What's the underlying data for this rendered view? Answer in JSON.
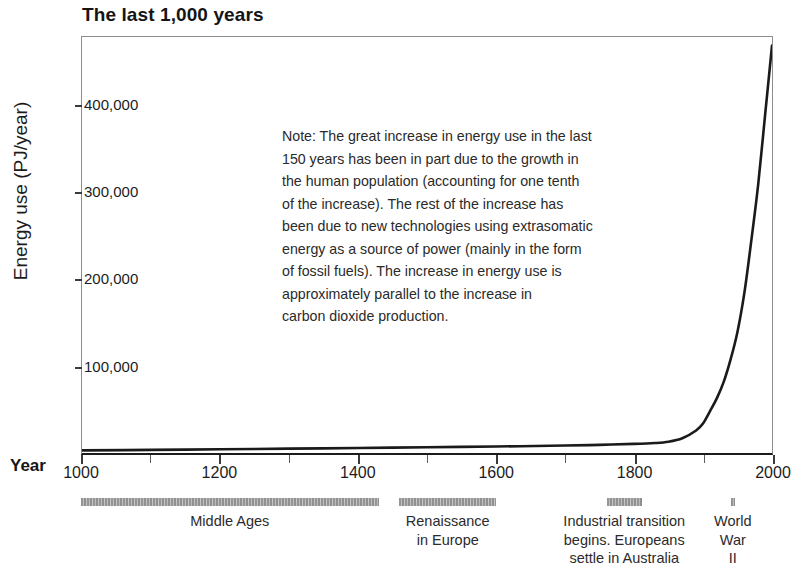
{
  "chart_data": {
    "type": "line",
    "title": "The last 1,000 years",
    "xlabel": "Year",
    "ylabel": "Energy use (PJ/year)",
    "xlim": [
      1000,
      2000
    ],
    "ylim": [
      0,
      480000
    ],
    "grid": false,
    "legend": "none",
    "x_ticks": [
      {
        "value": 1000,
        "label": "1000",
        "major": true
      },
      {
        "value": 1100,
        "label": "",
        "major": false
      },
      {
        "value": 1200,
        "label": "1200",
        "major": true
      },
      {
        "value": 1300,
        "label": "",
        "major": false
      },
      {
        "value": 1400,
        "label": "1400",
        "major": true
      },
      {
        "value": 1500,
        "label": "",
        "major": false
      },
      {
        "value": 1600,
        "label": "1600",
        "major": true
      },
      {
        "value": 1700,
        "label": "",
        "major": false
      },
      {
        "value": 1800,
        "label": "1800",
        "major": true
      },
      {
        "value": 1900,
        "label": "",
        "major": false
      },
      {
        "value": 2000,
        "label": "2000",
        "major": true
      }
    ],
    "y_ticks": [
      {
        "value": 100000,
        "label": "100,000"
      },
      {
        "value": 200000,
        "label": "200,000"
      },
      {
        "value": 300000,
        "label": "300,000"
      },
      {
        "value": 400000,
        "label": "400,000"
      }
    ],
    "series": [
      {
        "name": "World energy use",
        "color": "#1a1a1a",
        "x": [
          1000,
          1100,
          1200,
          1300,
          1400,
          1500,
          1600,
          1700,
          1750,
          1800,
          1830,
          1850,
          1870,
          1890,
          1900,
          1910,
          1920,
          1930,
          1940,
          1950,
          1960,
          1970,
          1980,
          1990,
          2000
        ],
        "y": [
          3000,
          3600,
          4300,
          5000,
          5800,
          6600,
          7500,
          8600,
          9400,
          10500,
          11500,
          13000,
          17000,
          26000,
          34000,
          48000,
          63000,
          82000,
          108000,
          140000,
          185000,
          245000,
          310000,
          390000,
          470000
        ]
      }
    ],
    "annotation_note": {
      "lines": [
        "Note: The great increase in energy use in the last",
        "150 years has been in part due to the growth in",
        "the human population (accounting for one tenth",
        "of the increase). The rest of the increase has",
        "been due to new technologies using extrasomatic",
        "energy as a source of power (mainly in the form",
        "of fossil fuels). The increase in energy use is",
        "approximately parallel to the increase in",
        "carbon dioxide production."
      ]
    },
    "era_bars": [
      {
        "name": "middle-ages",
        "label_lines": [
          "Middle Ages"
        ],
        "start_year": 1000,
        "end_year": 1430,
        "bar_color": "#8f8f8f"
      },
      {
        "name": "renaissance",
        "label_lines": [
          "Renaissance",
          "in Europe"
        ],
        "start_year": 1460,
        "end_year": 1600,
        "bar_color": "#8f8f8f"
      },
      {
        "name": "industrial-transition",
        "label_lines": [
          "Industrial transition",
          "begins. Europeans",
          "settle in Australia"
        ],
        "start_year": 1760,
        "end_year": 1810,
        "bar_color": "#8f8f8f"
      },
      {
        "name": "world-war-ii",
        "label_lines": [
          "World",
          "War",
          "II"
        ],
        "start_year": 1939,
        "end_year": 1945,
        "bar_color": "#8f8f8f"
      }
    ]
  }
}
